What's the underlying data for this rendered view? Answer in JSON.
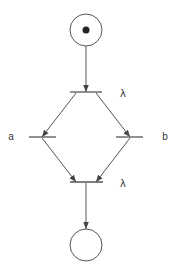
{
  "diagram": {
    "type": "petri-net",
    "colors": {
      "stroke": "#555555",
      "token": "#222222",
      "text": "#333333",
      "background": "#ffffff"
    },
    "places": [
      {
        "id": "p_start",
        "cx": 86,
        "cy": 30,
        "r": 16,
        "tokens": 1
      },
      {
        "id": "p_end",
        "cx": 86,
        "cy": 245,
        "r": 16,
        "tokens": 0
      }
    ],
    "transitions": [
      {
        "id": "t_split",
        "x1": 70,
        "x2": 102,
        "y": 92,
        "label": "λ",
        "label_x": 123,
        "label_y": 94
      },
      {
        "id": "t_a",
        "x1": 29,
        "x2": 56,
        "y": 137,
        "label": "a",
        "label_x": 11,
        "label_y": 137
      },
      {
        "id": "t_b",
        "x1": 116,
        "x2": 143,
        "y": 137,
        "label": "b",
        "label_x": 165,
        "label_y": 137
      },
      {
        "id": "t_join",
        "x1": 70,
        "x2": 103,
        "y": 182,
        "label": "λ",
        "label_x": 123,
        "label_y": 184
      }
    ],
    "arcs": [
      {
        "from": "p_start",
        "to": "t_split",
        "x1": 86,
        "y1": 46,
        "x2": 86,
        "y2": 92
      },
      {
        "from": "t_split",
        "to": "t_a",
        "x1": 76,
        "y1": 93,
        "x2": 42,
        "y2": 137
      },
      {
        "from": "t_split",
        "to": "t_b",
        "x1": 96,
        "y1": 93,
        "x2": 130,
        "y2": 137
      },
      {
        "from": "t_a",
        "to": "t_join",
        "x1": 42,
        "y1": 138,
        "x2": 76,
        "y2": 182
      },
      {
        "from": "t_b",
        "to": "t_join",
        "x1": 130,
        "y1": 138,
        "x2": 96,
        "y2": 182
      },
      {
        "from": "t_join",
        "to": "p_end",
        "x1": 86,
        "y1": 183,
        "x2": 86,
        "y2": 229
      }
    ]
  },
  "labels": {
    "t_split": "λ",
    "t_a": "a",
    "t_b": "b",
    "t_join": "λ"
  }
}
